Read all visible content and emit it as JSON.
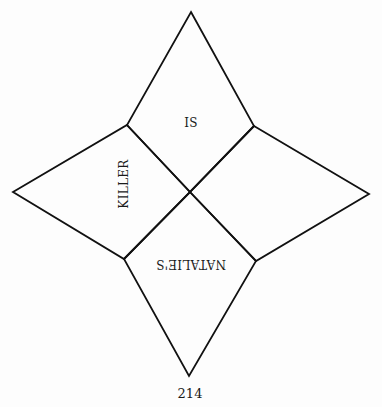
{
  "diagram": {
    "title": "",
    "shape": "four-pointed star composed of four kite-shaped quadrants",
    "stroke_color": "#111111",
    "background_color": "#fdfdfd",
    "vertices": {
      "top": [
        191,
        12
      ],
      "right": [
        369,
        194
      ],
      "bottom": [
        189,
        376
      ],
      "left": [
        13,
        192
      ],
      "upper_left_inner": [
        127,
        125
      ],
      "upper_right_inner": [
        254,
        126
      ],
      "lower_left_inner": [
        124,
        259
      ],
      "lower_right_inner": [
        256,
        261
      ],
      "center": [
        190,
        192
      ]
    },
    "quadrants": {
      "top": {
        "label": "IS",
        "rotation_deg": 0
      },
      "left": {
        "label": "KILLER",
        "rotation_deg": -90
      },
      "bottom": {
        "label": "NATALIE'S",
        "rotation_deg": 180
      },
      "right": {
        "label": "",
        "rotation_deg": 0
      }
    }
  },
  "page": {
    "number": "214"
  }
}
